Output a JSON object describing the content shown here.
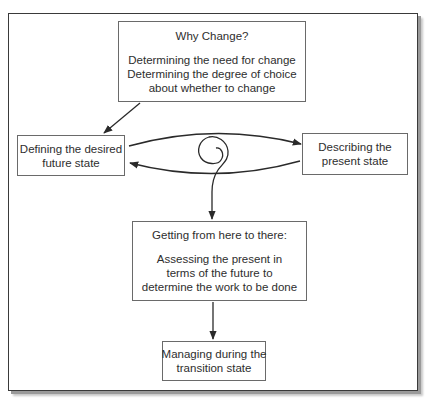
{
  "diagram": {
    "why_change": {
      "title": "Why Change?",
      "lines": [
        "Determining the need for change",
        "Determining the degree of choice",
        "about whether to change"
      ]
    },
    "desired_future_state": {
      "lines": [
        "Defining the desired",
        "future state"
      ]
    },
    "present_state": {
      "lines": [
        "Describing the",
        "present state"
      ]
    },
    "getting_there": {
      "title": "Getting from here to there:",
      "lines": [
        "Assessing the present in",
        "terms of the future to",
        "determine the work to be done"
      ]
    },
    "transition_state": {
      "lines": [
        "Managing during the",
        "transition state"
      ]
    },
    "colors": {
      "line": "#2a2a2a",
      "box_border": "#6a6a6a",
      "frame_border": "#3a3a3a",
      "shadow": "#9a9a9a"
    }
  }
}
